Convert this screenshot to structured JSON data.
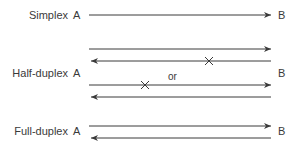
{
  "diagram": {
    "rows": [
      {
        "mode": "Simplex",
        "left_node": "A",
        "right_node": "B",
        "lines": [
          {
            "y": 15,
            "direction": "A-to-B",
            "blocked": false
          }
        ]
      },
      {
        "mode": "Half-duplex",
        "left_node": "A",
        "right_node": "B",
        "alternatives_separator": "or",
        "lines": [
          {
            "y": 49,
            "direction": "A-to-B",
            "blocked": false
          },
          {
            "y": 61,
            "direction": "B-to-A",
            "blocked": true,
            "x_mark_at": 209
          },
          {
            "y": 85,
            "direction": "A-to-B",
            "blocked": true,
            "x_mark_at": 145
          },
          {
            "y": 97,
            "direction": "B-to-A",
            "blocked": false
          }
        ]
      },
      {
        "mode": "Full-duplex",
        "left_node": "A",
        "right_node": "B",
        "lines": [
          {
            "y": 126,
            "direction": "A-to-B",
            "blocked": false
          },
          {
            "y": 138,
            "direction": "B-to-A",
            "blocked": false
          }
        ]
      }
    ],
    "colors": {
      "line": "#3a3a3a",
      "text": "#3a3a3a",
      "background": "#ffffff"
    }
  }
}
